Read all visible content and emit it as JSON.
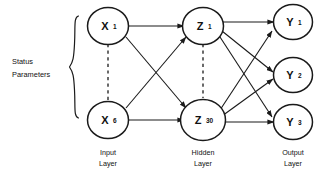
{
  "diagram": {
    "side_label": {
      "line1": "Status",
      "line2": "Parameters"
    },
    "layers": [
      {
        "id": "input",
        "caption_line1": "Input",
        "caption_line2": "Layer",
        "nodes": [
          {
            "base": "X",
            "sub": "1"
          },
          {
            "base": "X",
            "sub": "6"
          }
        ],
        "ellipsis": "vertical-dashed"
      },
      {
        "id": "hidden",
        "caption_line1": "Hidden",
        "caption_line2": "Layer",
        "nodes": [
          {
            "base": "Z",
            "sub": "1"
          },
          {
            "base": "Z",
            "sub": "30"
          }
        ],
        "ellipsis": "vertical-dashed"
      },
      {
        "id": "output",
        "caption_line1": "Output",
        "caption_line2": "Layer",
        "nodes": [
          {
            "base": "Y",
            "sub": "1"
          },
          {
            "base": "Y",
            "sub": "2"
          },
          {
            "base": "Y",
            "sub": "3"
          }
        ],
        "ellipsis": "none"
      }
    ],
    "connections": {
      "input_to_hidden": [
        {
          "from": "X1",
          "to": "Z1"
        },
        {
          "from": "X1",
          "to": "Z30"
        },
        {
          "from": "X6",
          "to": "Z1"
        },
        {
          "from": "X6",
          "to": "Z30"
        }
      ],
      "hidden_to_output": [
        {
          "from": "Z1",
          "to": "Y1"
        },
        {
          "from": "Z1",
          "to": "Y2"
        },
        {
          "from": "Z1",
          "to": "Y3"
        },
        {
          "from": "Z30",
          "to": "Y1"
        },
        {
          "from": "Z30",
          "to": "Y2"
        },
        {
          "from": "Z30",
          "to": "Y3"
        }
      ]
    },
    "colors": {
      "stroke": "#1a1a1a",
      "node_fill": "#ffffff",
      "background": "#ffffff",
      "text": "#111111"
    }
  }
}
